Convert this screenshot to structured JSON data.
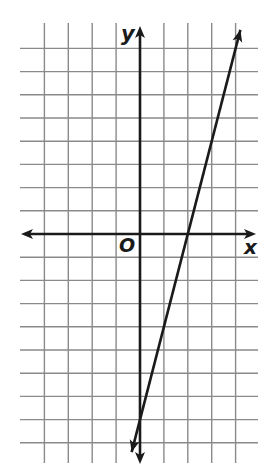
{
  "chart_data": {
    "type": "line",
    "title": "",
    "xlabel": "x",
    "ylabel": "y",
    "origin_label": "O",
    "grid": true,
    "xlim": [
      -4,
      4
    ],
    "ylim": [
      -9,
      8
    ],
    "x_grid_lines": [
      -4,
      -3,
      -2,
      -1,
      0,
      1,
      2,
      3,
      4
    ],
    "y_grid_lines": [
      -9,
      -8,
      -7,
      -6,
      -5,
      -4,
      -3,
      -2,
      -1,
      0,
      1,
      2,
      3,
      4,
      5,
      6,
      7,
      8
    ],
    "series": [
      {
        "name": "line",
        "equation": "y = 4x - 8",
        "slope": 4,
        "y_intercept": -8,
        "x_intercept": 2,
        "x": [
          -0.35,
          0,
          1,
          2,
          3,
          4,
          4.2
        ],
        "y": [
          -9.4,
          -8,
          -4,
          0,
          4,
          8,
          8.8
        ],
        "arrows_both_ends": true
      }
    ]
  },
  "colors": {
    "grid": "#8a8a8a",
    "axis": "#1a1a1a",
    "line": "#1a1a1a",
    "background": "#ffffff"
  }
}
